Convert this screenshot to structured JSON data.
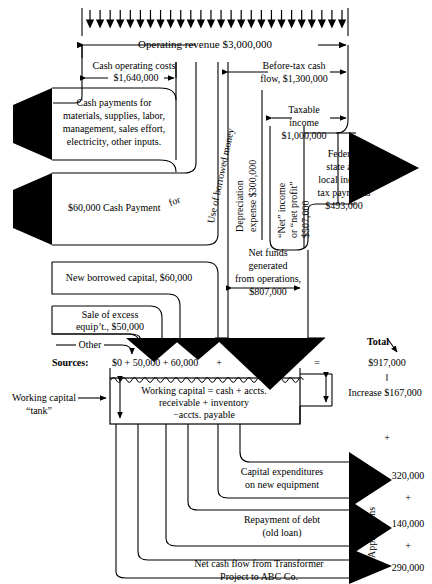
{
  "diagram": {
    "top": {
      "revenue_label": "Operating revenue $3,000,000",
      "inflow_arrow_count": 26
    },
    "left_column": {
      "cash_operating_costs_line1": "Cash operating costs",
      "cash_operating_costs_line2": "$1,640,000",
      "cash_payments_line1": "Cash payments for",
      "cash_payments_line2": "materials, supplies, labor,",
      "cash_payments_line3": "management, sales effort,",
      "cash_payments_line4": "electricity, other inputs.",
      "interest_payment": "$60,000 Cash Payment",
      "interest_payment_tail": "for"
    },
    "vertical_labels": {
      "use_of_borrowed_money": "Use of borrowed money",
      "depreciation": "Depreciation",
      "depreciation_amount": "expense $300,000",
      "net_income_line1": "“Net” income",
      "net_income_line2": "or “net profit”",
      "net_income_line3": "$507,000",
      "applications": "Applications"
    },
    "center_column": {
      "before_tax_line1": "Before-tax cash",
      "before_tax_line2": "flow, $1,300,000",
      "taxable_line1": "Taxable",
      "taxable_line2": "income",
      "taxable_line3": "$1,000,000",
      "net_funds_line1": "Net funds",
      "net_funds_line2": "generated",
      "net_funds_line3": "from operations,",
      "net_funds_line4": "$807,000"
    },
    "right_column": {
      "taxes_line1": "Federal,",
      "taxes_line2": "state and",
      "taxes_line3": "local income",
      "taxes_line4": "tax payments",
      "taxes_line5": "$493,000"
    },
    "sources_boxes": {
      "new_borrowed_capital": "New borrowed capital, $60,000",
      "sale_excess_line1": "Sale of excess",
      "sale_excess_line2": "equip’t., $50,000",
      "other": "Other"
    },
    "sources_row": {
      "label": "Sources:",
      "expression": "$0 + 50,000 + 60,000",
      "plus": "+",
      "operations": "807,000",
      "equals": "=",
      "total_word": "Total",
      "total_amount": "$917,000",
      "double_bar": "‖",
      "increase": "Increase $167,000",
      "plus_below": "+"
    },
    "tank": {
      "caller_line1": "Working capital",
      "caller_line2": "“tank”",
      "contents_line1": "Working capital = cash + accts.",
      "contents_line2": "receivable + inventory",
      "contents_line3": "−accts. payable"
    },
    "applications_rows": [
      {
        "label_line1": "Capital expenditures",
        "label_line2": "on new equipment",
        "amount": "320,000",
        "connector": "+"
      },
      {
        "label_line1": "Repayment of debt",
        "label_line2": "(old loan)",
        "amount": "140,000",
        "connector": "+"
      },
      {
        "label_line1": "Net cash flow from Transformer",
        "label_line2": "Project to ABC Co.",
        "amount": "290,000",
        "connector": ""
      }
    ],
    "colors": {
      "ink": "#000000",
      "paper": "#ffffff",
      "fill": "#000000"
    }
  }
}
